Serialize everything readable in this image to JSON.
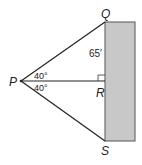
{
  "diagram": {
    "points": {
      "P": {
        "label": "P",
        "x": 21,
        "y": 81
      },
      "Q": {
        "label": "Q",
        "x": 105,
        "y": 22
      },
      "R": {
        "label": "R",
        "x": 105,
        "y": 81
      },
      "S": {
        "label": "S",
        "x": 105,
        "y": 141
      }
    },
    "angles": {
      "upper": "40°",
      "lower": "40°"
    },
    "lengths": {
      "QR": "65′"
    },
    "building": {
      "fill": "#c8c8c8",
      "stroke": "#555555"
    }
  }
}
